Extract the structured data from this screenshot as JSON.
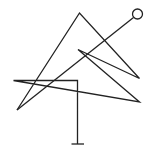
{
  "diagram": {
    "background": "#ffffff",
    "stroke": "#222222",
    "stroke_width": 1.3,
    "polyline_main": "17,110 79.5,13 139.5,78.5 78,49.5 139.5,102 13.5,80.5 77.5,80.5 77.5,144",
    "diagonal_line": {
      "x1": 17,
      "y1": 110,
      "x2": 133.5,
      "y2": 17.5
    },
    "end_circle": {
      "cx": 137.5,
      "cy": 14,
      "r": 5
    },
    "base_bar": {
      "x1": 71.5,
      "y1": 144,
      "x2": 84,
      "y2": 144
    }
  }
}
